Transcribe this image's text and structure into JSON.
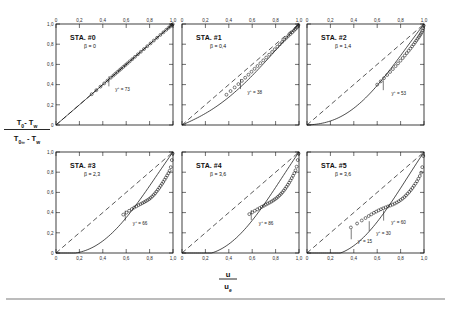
{
  "figure": {
    "axis_labels": {
      "y_numerator": "T₀ - T_w",
      "y_denominator": "T₀∞ - T_w",
      "y_num_main": "T",
      "x_numerator": "u",
      "x_denominator": "u",
      "x_denominator_sub": "e"
    },
    "tick_labels_x": [
      "0",
      "0,2",
      "0,4",
      "0,6",
      "0,8",
      "1,0"
    ],
    "tick_labels_y": [
      "0",
      "0,2",
      "0,4",
      "0,6",
      "0,8",
      "1,0"
    ],
    "tick_values": [
      0,
      0.2,
      0.4,
      0.6,
      0.8,
      1.0
    ],
    "beta_symbol": "β",
    "yplus_symbol": "y",
    "yplus_sup": "+",
    "equals": "=",
    "colors": {
      "ink": "#111111",
      "rule": "#7a7a7a",
      "background": "#ffffff"
    }
  },
  "chart_data": {
    "type": "line",
    "title": "",
    "xlabel": "u/u_e",
    "ylabel": "(T0 - Tw)/(T0inf - Tw)",
    "xlim": [
      0,
      1
    ],
    "ylim": [
      0,
      1
    ],
    "grid": false,
    "legend": "none",
    "reference_line": {
      "label": "Crocco linear relation",
      "style": "dashed",
      "x": [
        0,
        1
      ],
      "y": [
        0,
        1
      ]
    },
    "panels": [
      {
        "id": "sta-0",
        "station": "STA. #0",
        "beta_label": "β = 0",
        "beta": 0,
        "row": 0,
        "col": 0,
        "show_y_ticks": true,
        "show_x_ticks_top": true,
        "show_x_ticks_bottom": false,
        "curve_bow": 0.0,
        "series": [
          {
            "name": "measured total temperature profile",
            "marker": "open-circle",
            "x": [
              0.305,
              0.345,
              0.38,
              0.412,
              0.44,
              0.468,
              0.49,
              0.508,
              0.525,
              0.542,
              0.558,
              0.575,
              0.592,
              0.61,
              0.63,
              0.652,
              0.675,
              0.7,
              0.725,
              0.752,
              0.78,
              0.808,
              0.836,
              0.864,
              0.892,
              0.918,
              0.942,
              0.962,
              0.978,
              0.99,
              0.998
            ],
            "y": [
              0.305,
              0.345,
              0.38,
              0.412,
              0.44,
              0.468,
              0.49,
              0.508,
              0.525,
              0.542,
              0.558,
              0.575,
              0.592,
              0.61,
              0.63,
              0.652,
              0.675,
              0.7,
              0.725,
              0.752,
              0.78,
              0.808,
              0.836,
              0.864,
              0.892,
              0.918,
              0.942,
              0.962,
              0.978,
              0.99,
              0.998
            ]
          }
        ],
        "annotations": [
          {
            "text": "73",
            "x": 0.452,
            "y": 0.452,
            "label_dx": 0.055,
            "label_dy": -0.115
          }
        ]
      },
      {
        "id": "sta-1",
        "station": "STA. #1",
        "beta_label": "β = 0,4",
        "beta": 0.4,
        "row": 0,
        "col": 1,
        "show_y_ticks": false,
        "show_x_ticks_top": true,
        "show_x_ticks_bottom": false,
        "curve_bow": 0.16,
        "series": [
          {
            "name": "measured total temperature profile",
            "marker": "open-circle",
            "x": [
              0.38,
              0.415,
              0.45,
              0.482,
              0.512,
              0.54,
              0.568,
              0.594,
              0.62,
              0.645,
              0.67,
              0.695,
              0.72,
              0.745,
              0.77,
              0.793,
              0.815,
              0.836,
              0.856,
              0.875,
              0.893,
              0.91,
              0.927,
              0.942,
              0.956,
              0.968,
              0.979,
              0.988,
              0.995
            ],
            "y": [
              0.3,
              0.336,
              0.372,
              0.405,
              0.437,
              0.468,
              0.498,
              0.527,
              0.556,
              0.584,
              0.612,
              0.64,
              0.668,
              0.696,
              0.723,
              0.75,
              0.775,
              0.799,
              0.822,
              0.844,
              0.864,
              0.883,
              0.901,
              0.918,
              0.934,
              0.949,
              0.962,
              0.975,
              0.99
            ]
          }
        ],
        "annotations": [
          {
            "text": "38",
            "x": 0.5,
            "y": 0.425,
            "label_dx": 0.06,
            "label_dy": -0.12
          }
        ]
      },
      {
        "id": "sta-2",
        "station": "STA. #2",
        "beta_label": "β = 1,4",
        "beta": 1.4,
        "row": 0,
        "col": 2,
        "show_y_ticks": false,
        "show_x_ticks_top": true,
        "show_x_ticks_bottom": false,
        "curve_bow": 0.3,
        "series": [
          {
            "name": "measured total temperature profile",
            "marker": "open-circle",
            "x": [
              0.6,
              0.63,
              0.658,
              0.685,
              0.71,
              0.734,
              0.757,
              0.778,
              0.799,
              0.818,
              0.836,
              0.853,
              0.869,
              0.884,
              0.898,
              0.911,
              0.923,
              0.934,
              0.945,
              0.955,
              0.964,
              0.972,
              0.98,
              0.987,
              0.993,
              0.998
            ],
            "y": [
              0.4,
              0.432,
              0.464,
              0.495,
              0.525,
              0.554,
              0.583,
              0.61,
              0.637,
              0.663,
              0.688,
              0.712,
              0.735,
              0.757,
              0.778,
              0.798,
              0.817,
              0.835,
              0.853,
              0.87,
              0.886,
              0.901,
              0.918,
              0.936,
              0.958,
              0.985
            ]
          }
        ],
        "annotations": [
          {
            "text": "53",
            "x": 0.652,
            "y": 0.414,
            "label_dx": 0.07,
            "label_dy": -0.115
          }
        ]
      },
      {
        "id": "sta-3",
        "station": "STA. #3",
        "beta_label": "β = 2,3",
        "beta": 2.3,
        "row": 1,
        "col": 0,
        "show_y_ticks": true,
        "show_x_ticks_top": false,
        "show_x_ticks_bottom": true,
        "curve_bow": 0.36,
        "series": [
          {
            "name": "measured total temperature profile",
            "marker": "open-circle",
            "x": [
              0.575,
              0.602,
              0.625,
              0.648,
              0.668,
              0.687,
              0.705,
              0.722,
              0.738,
              0.753,
              0.768,
              0.782,
              0.796,
              0.809,
              0.822,
              0.835,
              0.847,
              0.859,
              0.871,
              0.883,
              0.894,
              0.906,
              0.917,
              0.928,
              0.939,
              0.95,
              0.961,
              0.971,
              0.981,
              0.99,
              0.997
            ],
            "y": [
              0.38,
              0.4,
              0.418,
              0.435,
              0.45,
              0.462,
              0.474,
              0.484,
              0.494,
              0.503,
              0.513,
              0.523,
              0.534,
              0.546,
              0.56,
              0.575,
              0.591,
              0.608,
              0.626,
              0.645,
              0.664,
              0.684,
              0.704,
              0.725,
              0.746,
              0.768,
              0.79,
              0.814,
              0.85,
              0.92,
              0.985
            ]
          }
        ],
        "annotations": [
          {
            "text": "66",
            "x": 0.592,
            "y": 0.39,
            "label_dx": 0.065,
            "label_dy": -0.115
          }
        ]
      },
      {
        "id": "sta-4",
        "station": "STA. #4",
        "beta_label": "β = 3,6",
        "beta": 3.6,
        "row": 1,
        "col": 1,
        "show_y_ticks": false,
        "show_x_ticks_top": false,
        "show_x_ticks_bottom": true,
        "curve_bow": 0.4,
        "series": [
          {
            "name": "measured total temperature profile",
            "marker": "open-circle",
            "x": [
              0.575,
              0.6,
              0.622,
              0.643,
              0.663,
              0.682,
              0.7,
              0.717,
              0.733,
              0.749,
              0.764,
              0.779,
              0.793,
              0.807,
              0.82,
              0.833,
              0.846,
              0.858,
              0.87,
              0.882,
              0.893,
              0.905,
              0.916,
              0.927,
              0.938,
              0.949,
              0.96,
              0.97,
              0.98,
              0.989,
              0.996
            ],
            "y": [
              0.385,
              0.402,
              0.418,
              0.432,
              0.445,
              0.457,
              0.468,
              0.479,
              0.489,
              0.499,
              0.509,
              0.52,
              0.531,
              0.543,
              0.556,
              0.57,
              0.585,
              0.601,
              0.618,
              0.636,
              0.655,
              0.675,
              0.696,
              0.718,
              0.741,
              0.765,
              0.79,
              0.818,
              0.855,
              0.92,
              0.985
            ]
          }
        ],
        "annotations": [
          {
            "text": "86",
            "x": 0.592,
            "y": 0.395,
            "label_dx": 0.065,
            "label_dy": -0.12
          }
        ]
      },
      {
        "id": "sta-5",
        "station": "STA. #5",
        "beta_label": "β = 3,6",
        "beta": 3.6,
        "row": 1,
        "col": 2,
        "show_y_ticks": false,
        "show_x_ticks_top": false,
        "show_x_ticks_bottom": true,
        "curve_bow": 0.42,
        "series": [
          {
            "name": "measured total temperature profile",
            "marker": "open-circle",
            "x": [
              0.375,
              0.428,
              0.468,
              0.5,
              0.527,
              0.55,
              0.572,
              0.592,
              0.612,
              0.632,
              0.652,
              0.672,
              0.692,
              0.712,
              0.732,
              0.75,
              0.768,
              0.785,
              0.801,
              0.817,
              0.832,
              0.846,
              0.86,
              0.874,
              0.888,
              0.901,
              0.914,
              0.927,
              0.94,
              0.952,
              0.964,
              0.975,
              0.985,
              0.994
            ],
            "y": [
              0.253,
              0.292,
              0.322,
              0.346,
              0.366,
              0.383,
              0.398,
              0.41,
              0.422,
              0.433,
              0.443,
              0.452,
              0.461,
              0.47,
              0.479,
              0.489,
              0.5,
              0.512,
              0.525,
              0.539,
              0.554,
              0.57,
              0.587,
              0.605,
              0.624,
              0.644,
              0.665,
              0.687,
              0.71,
              0.735,
              0.762,
              0.795,
              0.85,
              0.96
            ]
          }
        ],
        "annotations": [
          {
            "text": "15",
            "x": 0.378,
            "y": 0.205,
            "label_dx": 0.055,
            "label_dy": -0.105
          },
          {
            "text": "30",
            "x": 0.532,
            "y": 0.285,
            "label_dx": 0.06,
            "label_dy": -0.105
          },
          {
            "text": "60",
            "x": 0.655,
            "y": 0.39,
            "label_dx": 0.065,
            "label_dy": -0.105
          }
        ]
      }
    ]
  }
}
